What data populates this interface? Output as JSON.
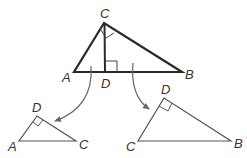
{
  "diagram": {
    "type": "similar right triangles",
    "main_triangle": {
      "labels": {
        "C": "C",
        "A": "A",
        "D": "D",
        "B": "B"
      },
      "right_angle_marks": [
        "C",
        "D"
      ]
    },
    "left_triangle": {
      "labels": {
        "D": "D",
        "A": "A",
        "C": "C"
      },
      "right_angle_marks": [
        "D"
      ]
    },
    "right_triangle": {
      "labels": {
        "D": "D",
        "C": "C",
        "B": "B"
      },
      "right_angle_marks": [
        "D"
      ]
    },
    "colors": {
      "main_stroke": "#2a2a2a",
      "sub_stroke": "#555555",
      "arrow": "#666666",
      "label": "#333333"
    }
  }
}
